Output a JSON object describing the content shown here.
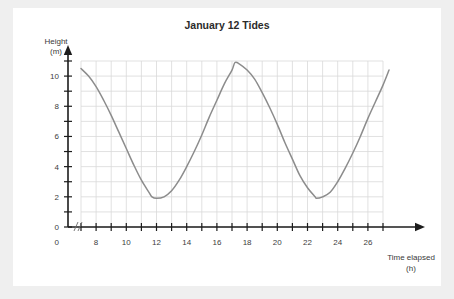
{
  "chart_data": {
    "type": "line",
    "title": "January 12 Tides",
    "xlabel": "Time elapsed",
    "xlabel_unit": "(h)",
    "ylabel": "Height",
    "ylabel_unit": "(m)",
    "xlim": [
      7,
      27.6
    ],
    "ylim": [
      0,
      11
    ],
    "grid": true,
    "grid_x_range": [
      7,
      27
    ],
    "grid_y_range": [
      0,
      11
    ],
    "grid_x_step": 1,
    "grid_y_step": 1,
    "legend": "none",
    "x_origin_label": "0",
    "x_axis_break": true,
    "x_tick_values": [
      7,
      8,
      9,
      10,
      11,
      12,
      13,
      14,
      15,
      16,
      17,
      18,
      19,
      20,
      21,
      22,
      23,
      24,
      25,
      26,
      27
    ],
    "x_tick_labels": [
      "",
      "8",
      "",
      "10",
      "",
      "12",
      "",
      "14",
      "",
      "16",
      "",
      "18",
      "",
      "20",
      "",
      "22",
      "",
      "24",
      "",
      "26",
      ""
    ],
    "y_tick_values": [
      0,
      1,
      2,
      3,
      4,
      5,
      6,
      7,
      8,
      9,
      10,
      11
    ],
    "y_tick_labels": [
      "0",
      "",
      "2",
      "",
      "4",
      "",
      "6",
      "",
      "8",
      "",
      "10",
      ""
    ],
    "curve_model": {
      "form": "sinusoid",
      "midline": 6.4,
      "amplitude": 4.5,
      "period": 10.9,
      "min_time_first": 11.7,
      "min_time_second": 22.6,
      "max_time": 17.2,
      "max_value": 10.9,
      "min_value": 1.9
    },
    "series": [
      {
        "name": "Tide height",
        "color": "#8c8c8c",
        "x": [
          7.0,
          7.5,
          8.0,
          8.5,
          9.0,
          9.5,
          10.0,
          10.5,
          11.0,
          11.5,
          11.7,
          12.0,
          12.5,
          13.0,
          13.5,
          14.0,
          14.5,
          15.0,
          15.5,
          16.0,
          16.5,
          17.0,
          17.2,
          17.5,
          18.0,
          18.5,
          19.0,
          19.5,
          20.0,
          20.5,
          21.0,
          21.5,
          22.0,
          22.5,
          22.6,
          23.0,
          23.5,
          24.0,
          24.5,
          25.0,
          25.5,
          26.0,
          26.5,
          27.0,
          27.4
        ],
        "y": [
          10.5,
          10.0,
          9.3,
          8.4,
          7.4,
          6.3,
          5.2,
          4.1,
          3.1,
          2.3,
          2.0,
          1.9,
          2.0,
          2.4,
          3.1,
          4.0,
          5.0,
          6.1,
          7.3,
          8.4,
          9.5,
          10.4,
          10.9,
          10.8,
          10.4,
          9.8,
          8.9,
          7.9,
          6.8,
          5.6,
          4.5,
          3.4,
          2.6,
          2.0,
          1.9,
          2.0,
          2.3,
          3.0,
          3.9,
          4.9,
          6.0,
          7.2,
          8.3,
          9.4,
          10.4
        ]
      }
    ]
  },
  "figure": {
    "title": "January 12 Tides",
    "y_axis_label_line1": "Height",
    "y_axis_label_line2": "(m)",
    "x_axis_label_line1": "Time elapsed",
    "x_axis_label_line2": "(h)"
  },
  "colors": {
    "page_background": "#efefef",
    "card_background": "#ffffff",
    "grid": "#d9d9d9",
    "axis": "#1c1c1c",
    "curve": "#8c8c8c",
    "text": "#2b2b2b"
  }
}
